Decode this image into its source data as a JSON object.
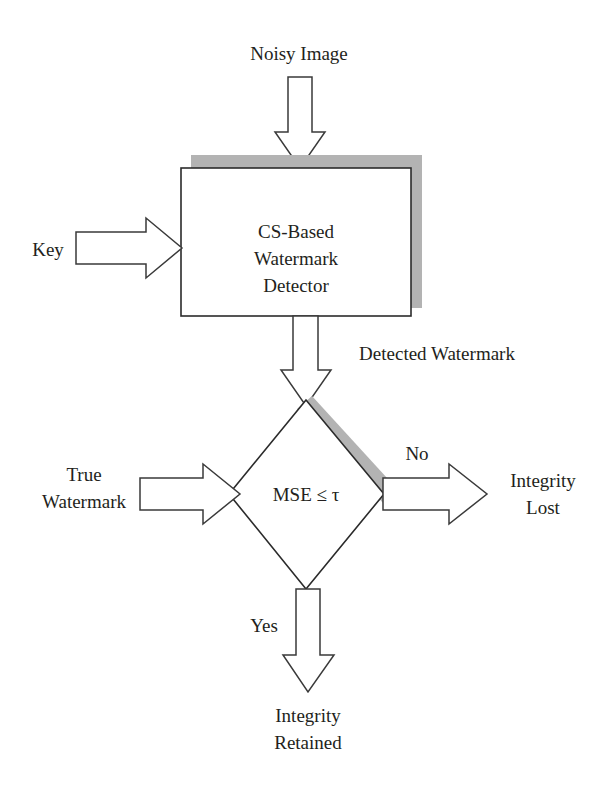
{
  "diagram": {
    "colors": {
      "shadow": "#b3b3b3",
      "outline": "#2b2b2b",
      "text": "#231f20",
      "background": "#ffffff"
    },
    "nodes": {
      "input_noisy_image": {
        "label": "Noisy Image",
        "type": "text-label"
      },
      "input_key": {
        "label": "Key",
        "type": "text-label"
      },
      "process_detector": {
        "line1": "CS-Based",
        "line2": "Watermark",
        "line3": "Detector",
        "type": "process-box",
        "has_shadow": true
      },
      "edge_detected_watermark": {
        "label": "Detected Watermark",
        "type": "edge-label"
      },
      "input_true_watermark": {
        "line1": "True",
        "line2": "Watermark",
        "type": "text-label"
      },
      "decision_mse": {
        "label": "MSE ≤ τ",
        "type": "decision-diamond",
        "has_shadow": true
      },
      "edge_no": {
        "label": "No",
        "type": "edge-label"
      },
      "edge_yes": {
        "label": "Yes",
        "type": "edge-label"
      },
      "output_integrity_lost": {
        "line1": "Integrity",
        "line2": "Lost",
        "type": "terminal-label"
      },
      "output_integrity_retained": {
        "line1": "Integrity",
        "line2": "Retained",
        "type": "terminal-label"
      }
    },
    "arrows": {
      "noisy_image_to_detector": "arrow-down-icon",
      "key_to_detector": "arrow-right-icon",
      "detector_to_decision": "arrow-down-icon",
      "true_watermark_to_decision": "arrow-right-icon",
      "decision_to_integrity_lost": "arrow-right-icon",
      "decision_to_integrity_retained": "arrow-down-icon"
    }
  }
}
